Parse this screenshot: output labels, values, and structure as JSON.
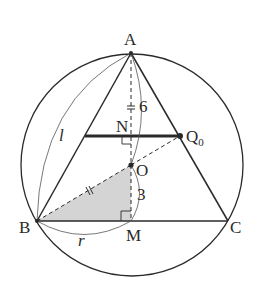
{
  "diagram": {
    "title": "",
    "colors": {
      "stroke": "#2a2a2a",
      "shade": "#d4d4d4",
      "background": "#ffffff"
    },
    "circle": {
      "cx": 132,
      "cy": 165,
      "r": 111
    },
    "points": {
      "A": {
        "label": "A",
        "x": 131,
        "y": 53
      },
      "B": {
        "label": "B",
        "x": 37,
        "y": 221
      },
      "C": {
        "label": "C",
        "x": 228,
        "y": 221
      },
      "M": {
        "label": "M",
        "x": 131,
        "y": 221
      },
      "O": {
        "label": "O",
        "x": 131,
        "y": 165
      },
      "N": {
        "label": "N",
        "x": 131,
        "y": 136
      },
      "Q0": {
        "label": "Q",
        "sub": "0",
        "x": 180,
        "y": 136
      }
    },
    "measures": {
      "AO": "6",
      "OM": "3",
      "BM": "r",
      "AB": "l"
    }
  }
}
